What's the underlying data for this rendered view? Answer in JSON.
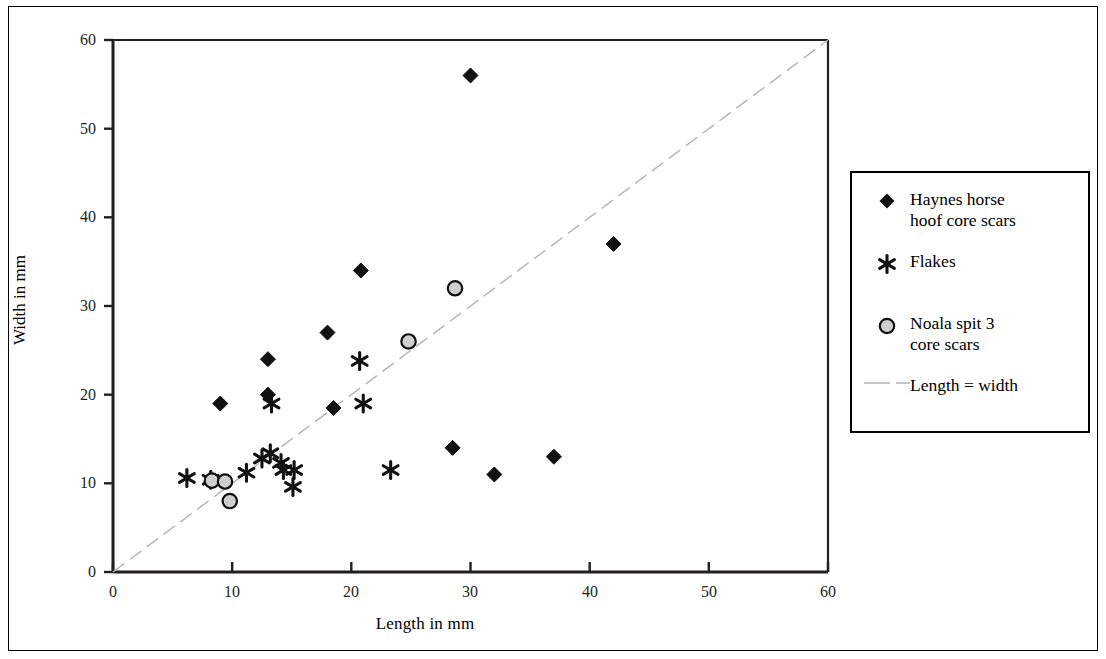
{
  "figure": {
    "background_color": "#ffffff",
    "frame_color": "#000000"
  },
  "axes": {
    "x_label": "Length in mm",
    "y_label": "Width in mm",
    "x_ticks": [
      "0",
      "10",
      "20",
      "30",
      "40",
      "50",
      "60"
    ],
    "y_ticks": [
      "0",
      "10",
      "20",
      "30",
      "40",
      "50",
      "60"
    ]
  },
  "legend": {
    "items": [
      {
        "label": "Haynes horse\nhoof core scars",
        "marker": "filled-diamond-marker",
        "color": "#000000"
      },
      {
        "label": "Flakes",
        "marker": "asterisk-marker",
        "color": "#000000"
      },
      {
        "label": "Noala spit 3\ncore scars",
        "marker": "gray-circle-marker",
        "color": "#cccccc"
      },
      {
        "label": "Length = width",
        "marker": "dashed-line-marker",
        "color": "#b3b3b3"
      }
    ]
  },
  "chart_data": {
    "type": "scatter",
    "title": "",
    "xlabel": "Length in mm",
    "ylabel": "Width in mm",
    "xlim": [
      0,
      60
    ],
    "ylim": [
      0,
      60
    ],
    "xticks": [
      0,
      10,
      20,
      30,
      40,
      50,
      60
    ],
    "yticks": [
      0,
      10,
      20,
      30,
      40,
      50,
      60
    ],
    "grid": false,
    "legend_position": "right",
    "reference_line": {
      "name": "Length = width",
      "from": [
        0,
        0
      ],
      "to": [
        60,
        60
      ],
      "style": "dashed",
      "color": "#b3b3b3"
    },
    "series": [
      {
        "name": "Haynes horse hoof core scars",
        "marker": "filled-diamond",
        "color": "#000000",
        "points": [
          [
            9,
            19
          ],
          [
            13,
            24
          ],
          [
            13,
            20
          ],
          [
            18.5,
            18.5
          ],
          [
            20.8,
            34
          ],
          [
            18,
            27
          ],
          [
            28.5,
            14
          ],
          [
            30,
            56
          ],
          [
            32,
            11
          ],
          [
            37,
            13
          ],
          [
            42,
            37
          ]
        ]
      },
      {
        "name": "Flakes",
        "marker": "asterisk",
        "color": "#000000",
        "points": [
          [
            6.2,
            10.6
          ],
          [
            8.2,
            10.4
          ],
          [
            11.2,
            11.2
          ],
          [
            12.5,
            12.8
          ],
          [
            13.2,
            13.4
          ],
          [
            13.3,
            19
          ],
          [
            14.1,
            12.3
          ],
          [
            14.3,
            11.5
          ],
          [
            15.1,
            9.6
          ],
          [
            15.2,
            11.5
          ],
          [
            20.7,
            23.8
          ],
          [
            21,
            19
          ],
          [
            23.3,
            11.5
          ]
        ]
      },
      {
        "name": "Noala spit 3 core scars",
        "marker": "gray-circle",
        "color": "#cccccc",
        "points": [
          [
            8.3,
            10.3
          ],
          [
            9.4,
            10.2
          ],
          [
            9.8,
            8
          ],
          [
            24.8,
            26
          ],
          [
            28.7,
            32
          ]
        ]
      }
    ]
  }
}
